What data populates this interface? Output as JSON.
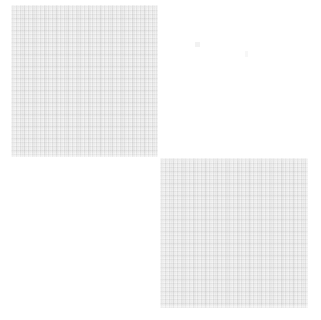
{
  "canvas": {
    "width": 321,
    "height": 320,
    "background_color": "#FFFFFF",
    "layout": "checkerboard",
    "description": "Two light gray fine-weave textured squares placed diagonally; top-right and bottom-left cells are empty white."
  },
  "palette": {
    "background": "#FFFFFF",
    "tile_base": "#F0F0F0",
    "tile_grid_light": "#FFFFFF",
    "tile_grid_dark": "#DEDEDE",
    "tile_grid_mid": "#F3F3F3"
  },
  "tiles": [
    {
      "id": "tile-top-left",
      "cell": "top-left",
      "x": 11,
      "y": 5,
      "width": 147,
      "height": 152,
      "fill": "#F0F0F0",
      "texture": "fine-grid-weave",
      "label": ""
    },
    {
      "id": "tile-bottom-right",
      "cell": "bottom-right",
      "x": 160,
      "y": 158,
      "width": 148,
      "height": 150,
      "fill": "#F0F0F0",
      "texture": "fine-grid-weave",
      "label": ""
    }
  ],
  "empty_cells": [
    {
      "id": "cell-top-right",
      "cell": "top-right",
      "x": 160,
      "y": 5,
      "width": 148,
      "height": 152,
      "fill": "#FFFFFF"
    },
    {
      "id": "cell-bottom-left",
      "cell": "bottom-left",
      "x": 11,
      "y": 158,
      "width": 147,
      "height": 150,
      "fill": "#FFFFFF"
    }
  ],
  "specks": [
    {
      "id": "speck-1",
      "x": 195,
      "y": 42,
      "width": 5,
      "height": 5,
      "color": "rgba(240,240,240,0.85)"
    },
    {
      "id": "speck-2",
      "x": 245,
      "y": 51,
      "width": 3,
      "height": 6,
      "color": "rgba(245,245,245,0.80)"
    }
  ]
}
